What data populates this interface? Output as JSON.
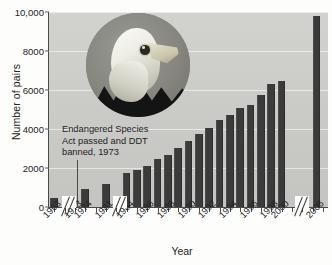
{
  "chart_data": {
    "type": "bar",
    "title": "",
    "xlabel": "Year",
    "ylabel": "Number of pairs",
    "ylim": [
      0,
      10000
    ],
    "yticks": [
      0,
      2000,
      4000,
      6000,
      8000,
      10000
    ],
    "ytick_labels": [
      "0",
      "2000",
      "4000",
      "6000",
      "8000",
      "10,000"
    ],
    "grid": true,
    "legend": "none",
    "axis_breaks": [
      "after 1963",
      "after 1974",
      "after 2000"
    ],
    "categories": [
      "1963",
      "1973",
      "1974",
      "1981",
      "1984",
      "1986",
      "1988",
      "1990",
      "1992",
      "1994",
      "1996",
      "1998",
      "2000",
      "2006"
    ],
    "tick_labels": [
      "1963",
      "1973",
      "1974",
      "1981",
      "1984",
      "1986",
      "1988",
      "1990",
      "1992",
      "1994",
      "1996",
      "1998",
      "2000",
      "2006"
    ],
    "bars": [
      {
        "year": "1963",
        "value": 487
      },
      {
        "year": "1974",
        "value": 900
      },
      {
        "year": "1981",
        "value": 1200
      },
      {
        "year": "1984",
        "value": 1760
      },
      {
        "year": "1986",
        "value": 1880
      },
      {
        "year": "1987",
        "value": 2120
      },
      {
        "year": "1988",
        "value": 2480
      },
      {
        "year": "1989",
        "value": 2680
      },
      {
        "year": "1990",
        "value": 3040
      },
      {
        "year": "1991",
        "value": 3400
      },
      {
        "year": "1992",
        "value": 3760
      },
      {
        "year": "1993",
        "value": 4060
      },
      {
        "year": "1994",
        "value": 4440
      },
      {
        "year": "1995",
        "value": 4720
      },
      {
        "year": "1996",
        "value": 5060
      },
      {
        "year": "1997",
        "value": 5240
      },
      {
        "year": "1998",
        "value": 5740
      },
      {
        "year": "1999",
        "value": 6300
      },
      {
        "year": "2000",
        "value": 6470
      },
      {
        "year": "2006",
        "value": 9800
      }
    ],
    "annotation": {
      "text": "Endangered Species\nAct passed and DDT\nbanned, 1973",
      "points_to": "1973"
    },
    "image_caption": "bald-eagle-photo",
    "colors": {
      "bar": "#3b3b3b",
      "plot_background": "#cbcbc8",
      "axis": "#4a4a4a",
      "text": "#232323",
      "gridline": "#ffffff"
    }
  }
}
